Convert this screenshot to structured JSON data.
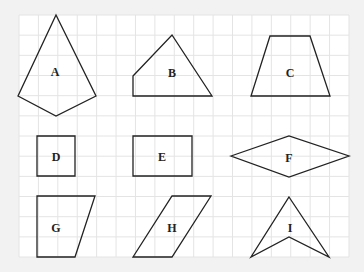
{
  "figure": {
    "background": "#f2f2f2",
    "paper": "#ffffff",
    "grid_color": "#e4e4e4",
    "stroke_color": "#222222",
    "grid": {
      "x0": 19,
      "y0": 15,
      "cols": 17,
      "rows": 12,
      "cell_w": 19.41,
      "cell_h": 20.17
    }
  },
  "shapes": [
    {
      "id": "A",
      "label": "A",
      "kind": "kite",
      "points": [
        [
          56,
          15
        ],
        [
          96,
          96
        ],
        [
          56,
          116
        ],
        [
          18,
          96
        ]
      ],
      "label_pos": [
        55,
        76
      ]
    },
    {
      "id": "B",
      "label": "B",
      "kind": "pentagon",
      "points": [
        [
          133,
          76
        ],
        [
          172,
          35
        ],
        [
          212,
          96
        ],
        [
          133,
          96
        ]
      ],
      "label_pos": [
        172,
        77
      ]
    },
    {
      "id": "C",
      "label": "C",
      "kind": "trapezoid",
      "points": [
        [
          270,
          36
        ],
        [
          310,
          36
        ],
        [
          330,
          96
        ],
        [
          251,
          96
        ]
      ],
      "label_pos": [
        290,
        77
      ]
    },
    {
      "id": "D",
      "label": "D",
      "kind": "square",
      "points": [
        [
          37,
          136
        ],
        [
          75,
          136
        ],
        [
          75,
          176
        ],
        [
          37,
          176
        ]
      ],
      "label_pos": [
        56,
        161
      ]
    },
    {
      "id": "E",
      "label": "E",
      "kind": "rectangle",
      "points": [
        [
          133,
          136
        ],
        [
          192,
          136
        ],
        [
          192,
          176
        ],
        [
          133,
          176
        ]
      ],
      "label_pos": [
        162,
        161
      ]
    },
    {
      "id": "F",
      "label": "F",
      "kind": "rhombus",
      "points": [
        [
          231,
          156
        ],
        [
          289,
          136
        ],
        [
          349,
          156
        ],
        [
          289,
          177
        ]
      ],
      "label_pos": [
        289,
        162
      ]
    },
    {
      "id": "G",
      "label": "G",
      "kind": "right trapezoid",
      "points": [
        [
          37,
          196
        ],
        [
          95,
          196
        ],
        [
          75,
          257
        ],
        [
          37,
          257
        ]
      ],
      "label_pos": [
        56,
        232
      ]
    },
    {
      "id": "H",
      "label": "H",
      "kind": "parallelogram",
      "points": [
        [
          172,
          196
        ],
        [
          211,
          196
        ],
        [
          172,
          257
        ],
        [
          133,
          257
        ]
      ],
      "label_pos": [
        172,
        232
      ]
    },
    {
      "id": "I",
      "label": "I",
      "kind": "dart",
      "points": [
        [
          289,
          197
        ],
        [
          329,
          257
        ],
        [
          289,
          237
        ],
        [
          251,
          257
        ]
      ],
      "label_pos": [
        290,
        232
      ]
    }
  ]
}
